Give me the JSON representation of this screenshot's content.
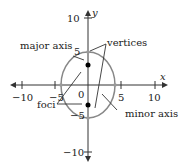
{
  "diagram": {
    "type": "ellipse-on-axes",
    "axes": {
      "x_label": "x",
      "y_label": "y",
      "x_ticks": [
        {
          "value": -10,
          "label": "−10"
        },
        {
          "value": -5,
          "label": "−5"
        },
        {
          "value": 5,
          "label": "5"
        },
        {
          "value": 10,
          "label": "10"
        }
      ],
      "y_ticks": [
        {
          "value": 10,
          "label": "10"
        },
        {
          "value": 5,
          "label": "5"
        },
        {
          "value": -5,
          "label": "−5"
        },
        {
          "value": -10,
          "label": "−10"
        }
      ],
      "origin_label": "0"
    },
    "ellipse": {
      "center": [
        0,
        0
      ],
      "semi_major_vertical": 5,
      "semi_minor_horizontal": 4,
      "vertices": [
        [
          0,
          5
        ],
        [
          0,
          -5
        ]
      ],
      "co_vertices": [
        [
          -4,
          0
        ],
        [
          4,
          0
        ]
      ],
      "foci": [
        [
          0,
          3
        ],
        [
          0,
          -3
        ]
      ],
      "stroke_color": "#888888"
    },
    "annotations": {
      "major_axis": "major axis",
      "vertices": "vertices",
      "foci": "foci",
      "minor_axis": "minor axis"
    }
  }
}
